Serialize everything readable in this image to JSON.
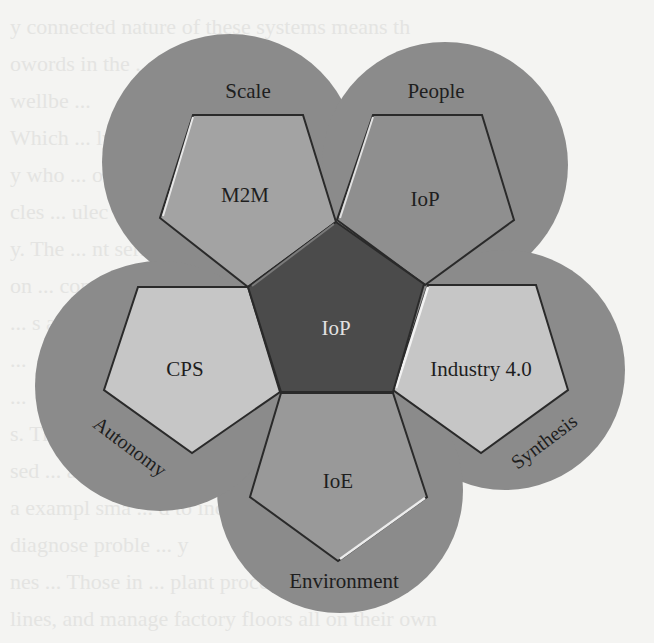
{
  "diagram": {
    "center": {
      "label": "IoP",
      "fill": "#4b4b4b",
      "text_color": "#e2e2e2"
    },
    "petals": [
      {
        "id": "top-left",
        "circle_label": "Scale",
        "pentagon_label": "M2M",
        "pentagon_fill": "#a3a3a3"
      },
      {
        "id": "top-right",
        "circle_label": "People",
        "pentagon_label": "IoP",
        "pentagon_fill": "#8f8f8f"
      },
      {
        "id": "right",
        "circle_label": "Synthesis",
        "pentagon_label": "Industry 4.0",
        "pentagon_fill": "#c6c6c6"
      },
      {
        "id": "bottom",
        "circle_label": "Environment",
        "pentagon_label": "IoE",
        "pentagon_fill": "#999999"
      },
      {
        "id": "left",
        "circle_label": "Autonomy",
        "pentagon_label": "CPS",
        "pentagon_fill": "#c6c6c6"
      }
    ],
    "circle_fill": "#8b8b8b",
    "outline_color": "#2a2a2a",
    "highlight_color": "#e6e6e6"
  },
  "page": {
    "background": "#f4f4f2",
    "bleed_through_lines": [
      "y connected nature of these systems means th",
      "owords in the ... other and cent",
      "wellbe ...",
      "Which ... ly autonomous",
      "y who ... ors con",
      "cles ... ulec abou",
      "y. The ... nt seri",
      "on ... commu",
      "... s a",
      "... ",
      "... ",
      "s. The ... aren",
      "sed ... a ra",
      "a exampl sma ... d to increases ar",
      "diagnose proble ... y",
      "nes ... Those in ... plant proces",
      "lines, and manage factory floors all on their own"
    ]
  }
}
